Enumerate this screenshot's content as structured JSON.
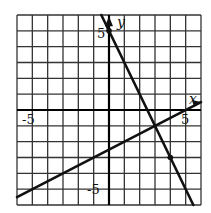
{
  "chart_data": {
    "type": "line",
    "title": "",
    "xlabel": "x",
    "ylabel": "y",
    "xlim": [
      -6,
      6
    ],
    "ylim": [
      -6,
      6
    ],
    "grid": true,
    "grid_step": 1,
    "tick_labels": {
      "x": [
        {
          "value": -5,
          "label": "-5"
        },
        {
          "value": 5,
          "label": "5"
        }
      ],
      "y": [
        {
          "value": 5,
          "label": "5"
        },
        {
          "value": -5,
          "label": "-5"
        }
      ]
    },
    "series": [
      {
        "name": "line-1",
        "equation": "y = -2x + 5",
        "slope": -2,
        "intercept": 5,
        "x": [
          -0.5,
          5.5
        ],
        "values": [
          6,
          -6
        ],
        "marked_points": [
          [
            0,
            5
          ],
          [
            4,
            -3
          ]
        ]
      },
      {
        "name": "line-2",
        "equation": "y = 0.5x - 2.5",
        "slope": 0.5,
        "intercept": -2.5,
        "x": [
          -6,
          6
        ],
        "values": [
          -5.5,
          0.5
        ]
      }
    ],
    "intersection": [
      3,
      -1
    ]
  },
  "labels": {
    "x_axis": "x",
    "y_axis": "y",
    "x_neg": "-5",
    "x_pos": "5",
    "y_pos": "5",
    "y_neg": "-5"
  },
  "colors": {
    "grid": "#333333",
    "axis": "#000000",
    "line": "#111111",
    "background": "#ffffff"
  }
}
